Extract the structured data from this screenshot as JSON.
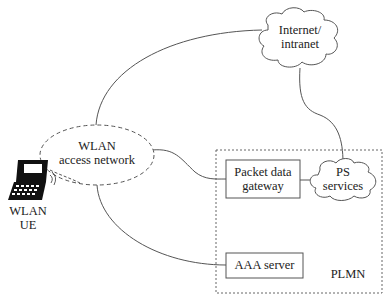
{
  "diagram": {
    "type": "network-architecture",
    "nodes": {
      "wlan_ue": {
        "label_line1": "WLAN",
        "label_line2": "UE",
        "icon": "laptop-icon"
      },
      "wlan_access_network": {
        "label_line1": "WLAN",
        "label_line2": "access network",
        "shape": "dashed-ellipse"
      },
      "internet": {
        "label_line1": "Internet/",
        "label_line2": "intranet",
        "shape": "cloud"
      },
      "packet_data_gateway": {
        "label_line1": "Packet data",
        "label_line2": "gateway",
        "shape": "rectangle"
      },
      "ps_services": {
        "label_line1": "PS",
        "label_line2": "services",
        "shape": "cloud"
      },
      "aaa_server": {
        "label": "AAA server",
        "shape": "rectangle"
      },
      "plmn": {
        "label": "PLMN",
        "shape": "dashed-rectangle"
      }
    },
    "edges": [
      {
        "from": "WLAN UE",
        "to": "WLAN access network",
        "style": "dashed"
      },
      {
        "from": "WLAN access network",
        "to": "Internet/intranet",
        "style": "solid"
      },
      {
        "from": "WLAN access network",
        "to": "Packet data gateway",
        "style": "solid"
      },
      {
        "from": "WLAN access network",
        "to": "AAA server",
        "style": "solid"
      },
      {
        "from": "Internet/intranet",
        "to": "PS services",
        "style": "solid"
      },
      {
        "from": "Packet data gateway",
        "to": "PS services",
        "style": "solid"
      }
    ],
    "colors": {
      "stroke": "#555555",
      "text": "#222222",
      "background": "#ffffff"
    }
  }
}
